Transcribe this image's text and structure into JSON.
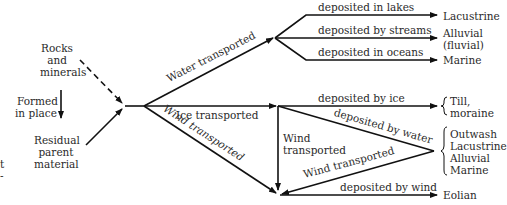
{
  "diagram": {
    "sources": {
      "rocks": [
        "Rocks",
        "and",
        "minerals"
      ],
      "formed": [
        "Formed",
        "in place"
      ],
      "residual": [
        "Residual",
        "parent",
        "material"
      ]
    },
    "transport": {
      "water": "Water transported",
      "ice": "Ice transported",
      "wind": "Wind transported",
      "wind_vertical": [
        "Wind",
        "transported"
      ],
      "wind_return": "Wind transported"
    },
    "deposition": {
      "lakes": "deposited in lakes",
      "streams": "deposited by streams",
      "oceans": "deposited in oceans",
      "ice": "deposited by ice",
      "water": "deposited by water",
      "wind": "deposited by wind"
    },
    "results": {
      "lacustrine": "Lacustrine",
      "alluvial": [
        "Alluvial",
        "(fluvial)"
      ],
      "marine": "Marine",
      "till": [
        "Till,",
        "moraine"
      ],
      "group": [
        "Outwash",
        "Lacustrine",
        "Alluvial",
        "Marine"
      ],
      "eolian": "Eolian"
    },
    "edge_fragments": [
      "t",
      "-"
    ]
  }
}
